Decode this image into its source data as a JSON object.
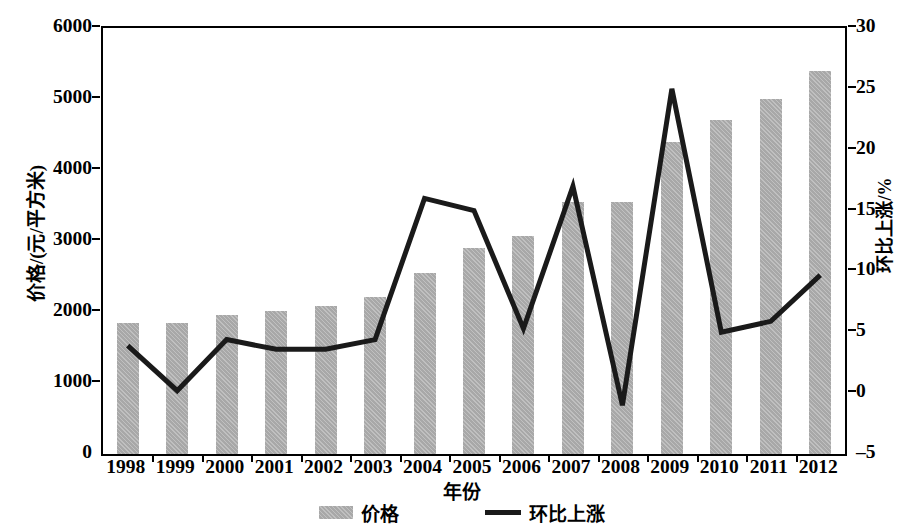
{
  "chart_data": {
    "type": "bar",
    "title": "",
    "xlabel": "年份",
    "ylabel": "价格/(元/平方米)",
    "ylabel_right": "环比上涨/%",
    "categories": [
      "1998",
      "1999",
      "2000",
      "2001",
      "2002",
      "2003",
      "2004",
      "2005",
      "2006",
      "2007",
      "2008",
      "2009",
      "2010",
      "2011",
      "2012"
    ],
    "series": [
      {
        "name": "价格",
        "type": "bar",
        "axis": "left",
        "color": "#a8a8a8",
        "values": [
          1850,
          1850,
          1960,
          2010,
          2090,
          2210,
          2550,
          2900,
          3070,
          3550,
          3550,
          4400,
          4700,
          5000,
          5400
        ]
      },
      {
        "name": "环比上涨",
        "type": "line",
        "axis": "right",
        "color": "#1a1a1a",
        "values": [
          3.9,
          0.2,
          4.4,
          3.6,
          3.6,
          4.4,
          16.0,
          15.0,
          5.3,
          17.0,
          -1.0,
          25.0,
          5.0,
          5.9,
          9.7
        ]
      }
    ],
    "ylim": [
      0,
      6000
    ],
    "yticks": [
      0,
      1000,
      2000,
      3000,
      4000,
      5000,
      6000
    ],
    "ylim_right": [
      -5,
      30
    ],
    "yticks_right": [
      -5,
      0,
      5,
      10,
      15,
      20,
      25,
      30
    ],
    "grid": false,
    "legend_position": "bottom",
    "legend": [
      "价格",
      "环比上涨"
    ]
  }
}
